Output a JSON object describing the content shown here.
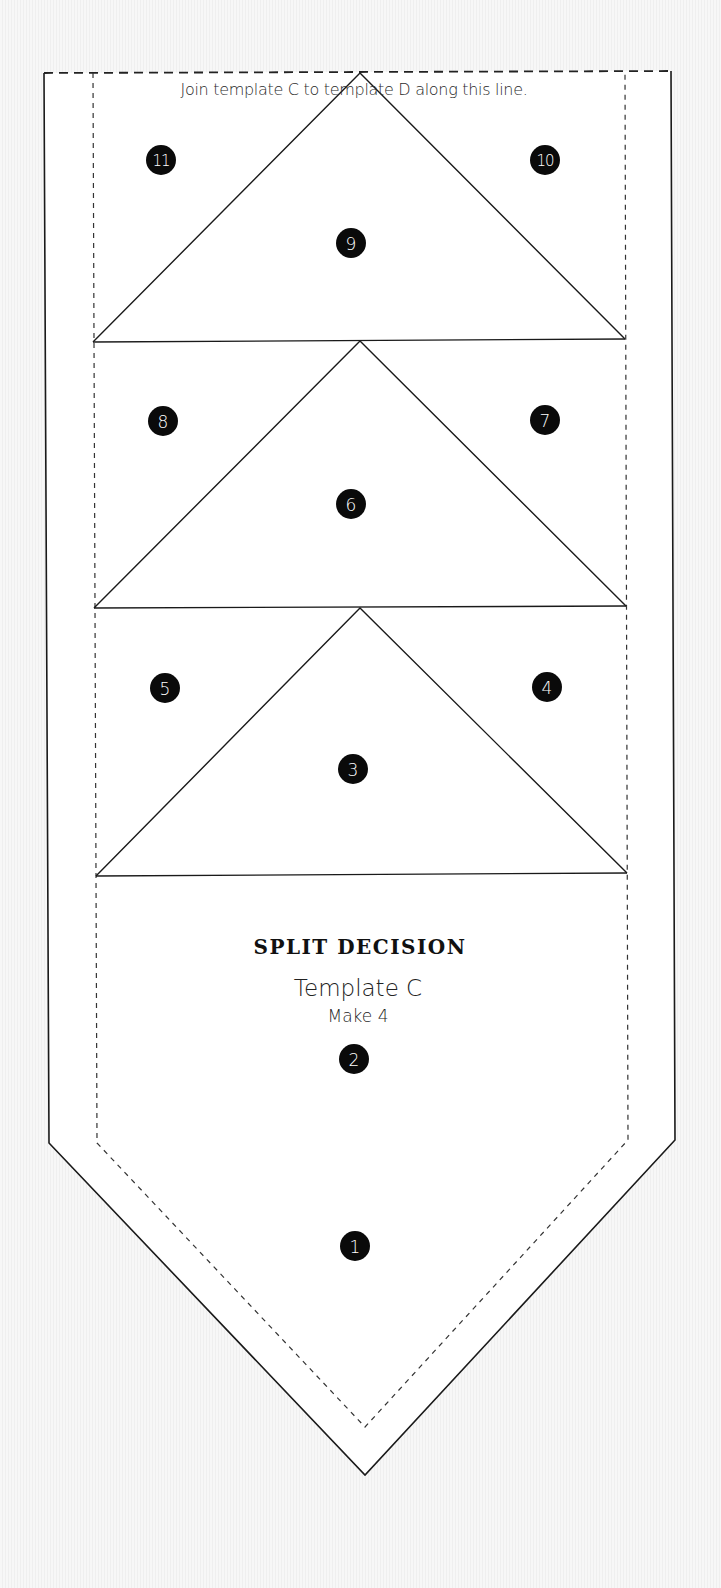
{
  "template": {
    "instruction": "Join template C to template D along this line.",
    "title": "SPLIT DECISION",
    "subtitle": "Template C",
    "quantity": "Make 4"
  },
  "colors": {
    "line": "#1a1a1a",
    "dashed_line": "#333333",
    "marker_fill": "#0a0a0a",
    "marker_text": "#ffffff",
    "paper": "#ffffff",
    "background": "#f4f4f4"
  },
  "markers": [
    {
      "label": "11",
      "x": 161,
      "y": 160
    },
    {
      "label": "10",
      "x": 545,
      "y": 160
    },
    {
      "label": "9",
      "x": 351,
      "y": 243
    },
    {
      "label": "8",
      "x": 163,
      "y": 421
    },
    {
      "label": "7",
      "x": 545,
      "y": 420
    },
    {
      "label": "6",
      "x": 351,
      "y": 504
    },
    {
      "label": "5",
      "x": 165,
      "y": 688
    },
    {
      "label": "4",
      "x": 547,
      "y": 687
    },
    {
      "label": "3",
      "x": 353,
      "y": 769
    },
    {
      "label": "2",
      "x": 354,
      "y": 1059
    },
    {
      "label": "1",
      "x": 355,
      "y": 1246
    }
  ]
}
